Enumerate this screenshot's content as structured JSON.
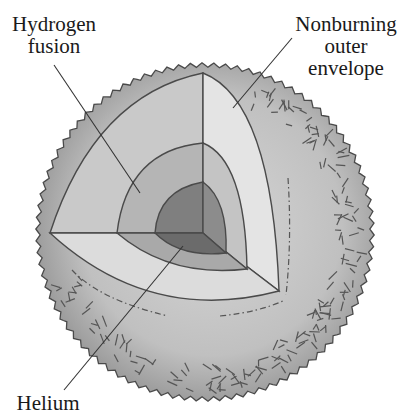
{
  "figure": {
    "type": "star interior cutaway diagram",
    "labels": {
      "hydrogen_fusion": [
        "Hydrogen",
        "fusion"
      ],
      "nonburning_envelope": [
        "Nonburning",
        "outer",
        "envelope"
      ],
      "helium": "Helium"
    },
    "colors": {
      "background": "#ffffff",
      "outline": "#4a4a4a",
      "envelope_fill": "#b8b8b8",
      "envelope_edge": "#8e8e8e",
      "outer_shell_face": "#cfcfcf",
      "outer_shell_light_face": "#e2e2e2",
      "hydrogen_shell_face": "#b3b3b3",
      "hydrogen_shell_lower": "#a6a6a6",
      "core_face": "#7d7d7d",
      "core_lower": "#6a6a6a",
      "text": "#1a1a1a"
    }
  }
}
